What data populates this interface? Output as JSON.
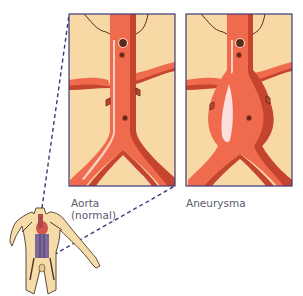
{
  "figure": {
    "panels": [
      {
        "id": "normal",
        "label_line1": "Aorta",
        "label_line2": "(normal)"
      },
      {
        "id": "aneurysm",
        "label_line1": "Aneurysma"
      }
    ],
    "colors": {
      "background_panel": "#f8d8a4",
      "panel_border": "#3c3a78",
      "artery_main": "#f06a4e",
      "artery_shadow": "#c4442e",
      "artery_highlight": "#fbd0c0",
      "aneurysm_highlight": "#fde0de",
      "vessel_dark": "#5a2a1a",
      "dashed_line": "#3c3a78",
      "body_skin": "#f6dca8",
      "body_outline": "#4a3a2a",
      "abdomen_purple": "#7e6a9a",
      "label_text": "#5a5a6a"
    }
  }
}
